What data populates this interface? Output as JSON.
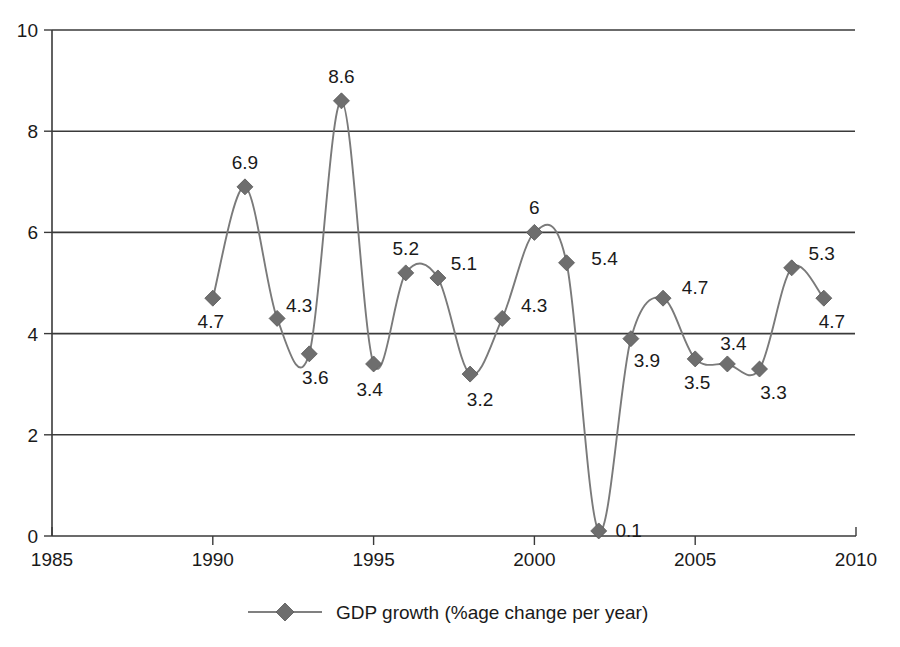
{
  "chart_data": {
    "type": "line",
    "title": "",
    "subtitle": "",
    "xlabel": "",
    "ylabel": "",
    "x": [
      1990,
      1991,
      1992,
      1993,
      1994,
      1995,
      1996,
      1997,
      1998,
      1999,
      2000,
      2001,
      2002,
      2003,
      2004,
      2005,
      2006,
      2007,
      2008,
      2009
    ],
    "values": [
      4.7,
      6.9,
      4.3,
      3.6,
      8.6,
      3.4,
      5.2,
      5.1,
      3.2,
      4.3,
      6,
      5.4,
      0.1,
      3.9,
      4.7,
      3.5,
      3.4,
      3.3,
      5.3,
      4.7
    ],
    "point_labels": [
      "4.7",
      "6.9",
      "4.3",
      "3.6",
      "8.6",
      "3.4",
      "5.2",
      "5.1",
      "3.2",
      "4.3",
      "6",
      "5.4",
      "0.1",
      "3.9",
      "4.7",
      "3.5",
      "3.4",
      "3.3",
      "5.3",
      "4.7"
    ],
    "series": [
      {
        "name": "GDP growth (%age change per year)",
        "values": [
          4.7,
          6.9,
          4.3,
          3.6,
          8.6,
          3.4,
          5.2,
          5.1,
          3.2,
          4.3,
          6,
          5.4,
          0.1,
          3.9,
          4.7,
          3.5,
          3.4,
          3.3,
          5.3,
          4.7
        ],
        "color": "#6e6e6e",
        "marker": "diamond"
      }
    ],
    "xlim": [
      1985,
      2010
    ],
    "ylim": [
      0,
      10
    ],
    "xticks": [
      1985,
      1990,
      1995,
      2000,
      2005,
      2010
    ],
    "xtick_labels": [
      "1985",
      "1990",
      "1995",
      "2000",
      "2005",
      "2010"
    ],
    "yticks": [
      0,
      2,
      4,
      6,
      8,
      10
    ],
    "ytick_labels": [
      "0",
      "2",
      "4",
      "6",
      "8",
      "10"
    ],
    "grid": "horizontal",
    "legend_position": "bottom",
    "legend": [
      {
        "label": "GDP growth (%age change per year)",
        "color": "#6e6e6e",
        "marker": "diamond"
      }
    ],
    "colors": {
      "line": "#7a7a7a",
      "marker": "#6e6e6e",
      "axis": "#3a3a3a",
      "text": "#1a1a1a",
      "background": "#ffffff"
    }
  }
}
